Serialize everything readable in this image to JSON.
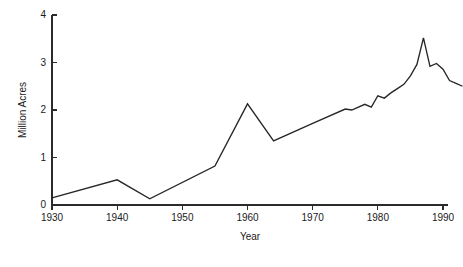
{
  "chart_data": {
    "type": "line",
    "title": "",
    "xlabel": "Year",
    "ylabel": "Million Acres",
    "xlim": [
      1930,
      1993
    ],
    "ylim": [
      0,
      4
    ],
    "grid": false,
    "legend": null,
    "xticks": [
      1930,
      1940,
      1950,
      1960,
      1970,
      1980,
      1990
    ],
    "xtick_labels": [
      "1930",
      "1940",
      "1950",
      "1960",
      "1970",
      "1980",
      "1990"
    ],
    "yticks": [
      0,
      1,
      2,
      3,
      4
    ],
    "ytick_labels": [
      "0",
      "1",
      "2",
      "3",
      "4"
    ],
    "series": [
      {
        "name": "Million Acres",
        "color": "#262626",
        "x": [
          1930,
          1940,
          1945,
          1955,
          1960,
          1964,
          1970,
          1975,
          1976,
          1978,
          1979,
          1980,
          1981,
          1982,
          1983,
          1984,
          1985,
          1986,
          1987,
          1988,
          1989,
          1990,
          1991,
          1992,
          1993
        ],
        "values": [
          0.15,
          0.53,
          0.13,
          0.82,
          2.13,
          1.35,
          1.72,
          2.02,
          2.0,
          2.12,
          2.06,
          2.3,
          2.25,
          2.36,
          2.45,
          2.54,
          2.72,
          2.96,
          3.52,
          2.92,
          2.98,
          2.86,
          2.62,
          2.56,
          2.5
        ]
      }
    ]
  }
}
